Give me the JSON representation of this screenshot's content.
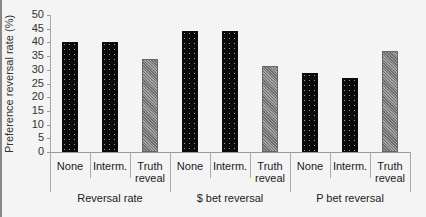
{
  "chart_data": {
    "type": "bar",
    "title": "",
    "xlabel": "",
    "ylabel": "Preference reversal rate (%)",
    "ylim": [
      0,
      50
    ],
    "yticks": [
      0,
      5,
      10,
      15,
      20,
      25,
      30,
      35,
      40,
      45,
      50
    ],
    "grid": false,
    "legend": null,
    "groups": [
      {
        "name": "Reversal rate",
        "categories": [
          "None",
          "Interm.",
          "Truth reveal"
        ],
        "values": [
          40,
          40,
          34
        ]
      },
      {
        "name": "$ bet reversal",
        "categories": [
          "None",
          "Interm.",
          "Truth reveal"
        ],
        "values": [
          44,
          44,
          31.5
        ]
      },
      {
        "name": "P bet reversal",
        "categories": [
          "None",
          "Interm.",
          "Truth reveal"
        ],
        "values": [
          29,
          27,
          37
        ]
      }
    ],
    "bar_styles": {
      "None": "black-dotted",
      "Interm.": "black-dotted",
      "Truth reveal": "gray-hatched"
    }
  },
  "labels": {
    "ylabel": "Preference reversal rate (%)",
    "ticks": [
      "0",
      "5",
      "10",
      "15",
      "20",
      "25",
      "30",
      "35",
      "40",
      "45",
      "50"
    ],
    "cat": [
      [
        "None"
      ],
      [
        "Interm."
      ],
      [
        "Truth",
        "reveal"
      ],
      [
        "None"
      ],
      [
        "Interm."
      ],
      [
        "Truth",
        "reveal"
      ],
      [
        "None"
      ],
      [
        "Interm."
      ],
      [
        "Truth",
        "reveal"
      ]
    ],
    "groups": [
      "Reversal rate",
      "$ bet reversal",
      "P bet reversal"
    ]
  }
}
